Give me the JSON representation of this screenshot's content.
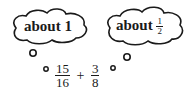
{
  "bubbles": [
    {
      "label": "about",
      "value_text": "1"
    },
    {
      "label": "about",
      "fraction": {
        "numerator": "1",
        "denominator": "2"
      }
    }
  ],
  "expression": {
    "terms": [
      {
        "numerator": "15",
        "denominator": "16"
      },
      {
        "numerator": "3",
        "denominator": "8"
      }
    ],
    "operator": "+"
  }
}
